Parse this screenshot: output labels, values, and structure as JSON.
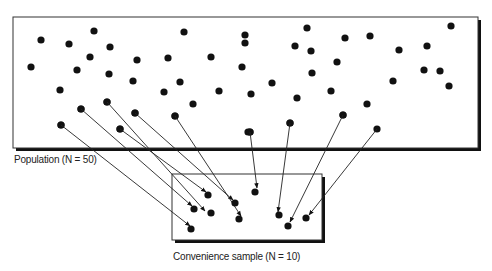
{
  "labels": {
    "population": "Population (N = 50)",
    "sample": "Convenience sample (N = 10)"
  },
  "colors": {
    "ink": "#111111",
    "background": "#ffffff"
  },
  "population_box": {
    "x": 13,
    "y": 17,
    "w": 465,
    "h": 131
  },
  "sample_box": {
    "x": 172,
    "y": 174,
    "w": 150,
    "h": 66
  },
  "population_dots": [
    [
      41,
      40
    ],
    [
      69,
      44
    ],
    [
      94,
      31
    ],
    [
      110,
      47
    ],
    [
      31,
      67
    ],
    [
      90,
      57
    ],
    [
      77,
      70
    ],
    [
      137,
      60
    ],
    [
      168,
      58
    ],
    [
      109,
      74
    ],
    [
      133,
      81
    ],
    [
      164,
      92
    ],
    [
      180,
      82
    ],
    [
      60,
      90
    ],
    [
      107,
      102
    ],
    [
      135,
      113
    ],
    [
      175,
      116
    ],
    [
      61,
      125
    ],
    [
      81,
      109
    ],
    [
      120,
      129
    ],
    [
      184,
      32
    ],
    [
      245,
      43
    ],
    [
      211,
      57
    ],
    [
      193,
      104
    ],
    [
      219,
      91
    ],
    [
      245,
      35
    ],
    [
      242,
      67
    ],
    [
      251,
      94
    ],
    [
      250,
      132
    ],
    [
      248,
      132
    ],
    [
      307,
      28
    ],
    [
      295,
      46
    ],
    [
      311,
      51
    ],
    [
      345,
      38
    ],
    [
      370,
      36
    ],
    [
      399,
      50
    ],
    [
      427,
      46
    ],
    [
      451,
      26
    ],
    [
      337,
      62
    ],
    [
      312,
      73
    ],
    [
      424,
      70
    ],
    [
      440,
      71
    ],
    [
      449,
      86
    ],
    [
      393,
      81
    ],
    [
      272,
      83
    ],
    [
      297,
      98
    ],
    [
      331,
      91
    ],
    [
      367,
      104
    ],
    [
      290,
      123
    ],
    [
      343,
      115
    ]
  ],
  "sample_dots": [
    [
      208,
      195
    ],
    [
      194,
      209
    ],
    [
      211,
      213
    ],
    [
      235,
      203
    ],
    [
      239,
      219
    ],
    [
      255,
      192
    ],
    [
      191,
      229
    ],
    [
      279,
      215
    ],
    [
      288,
      226
    ],
    [
      306,
      218
    ]
  ],
  "arrows": [
    [
      61,
      125,
      190,
      226
    ],
    [
      81,
      109,
      192,
      206
    ],
    [
      107,
      102,
      205,
      211
    ],
    [
      120,
      129,
      206,
      192
    ],
    [
      135,
      113,
      233,
      200
    ],
    [
      175,
      116,
      241,
      216
    ],
    [
      250,
      132,
      257,
      188
    ],
    [
      290,
      123,
      278,
      212
    ],
    [
      343,
      115,
      290,
      222
    ],
    [
      377,
      129,
      309,
      215
    ]
  ]
}
